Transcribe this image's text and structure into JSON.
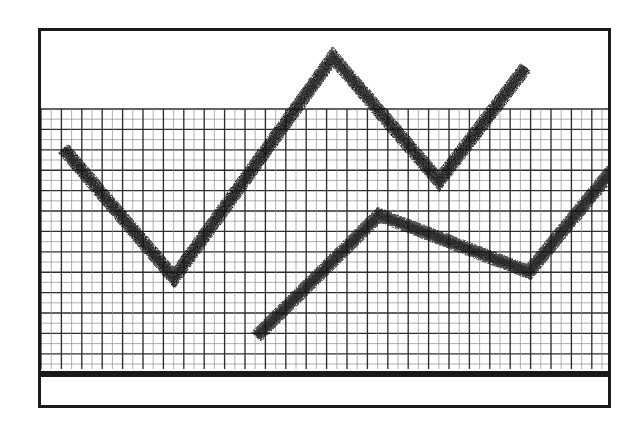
{
  "figure": {
    "kind": "hand-drawn-line-chart",
    "background_color": "#ffffff",
    "ink_color": "#111111",
    "frame": {
      "border_color": "#1a1a1a",
      "border_width_px": 3,
      "x": 38,
      "y": 28,
      "width": 573,
      "height": 380
    },
    "grid": {
      "visible": true,
      "color_minor": "#8e8e8e",
      "color_major": "#2f2f2f",
      "cell_px": 10.2,
      "major_every": 2,
      "top_px": 78,
      "bottom_px": 338,
      "left_px": 0,
      "right_px": 570
    },
    "baseline_bar": {
      "visible": true,
      "color": "#1a1a1a",
      "top_px": 340,
      "height_px": 6
    }
  },
  "chart_data": {
    "type": "line",
    "title": "",
    "subtitle": "",
    "xlabel": "",
    "ylabel": "",
    "grid": true,
    "legend_position": "none",
    "xlim": [
      0,
      573
    ],
    "ylim": [
      0,
      380
    ],
    "axis_tick_labels": {
      "x": [],
      "y": []
    },
    "annotations": [],
    "series": [
      {
        "name": "upper-trace",
        "stroke_width": 14,
        "texture": "stipple",
        "points": [
          {
            "x": 22,
            "y": 117
          },
          {
            "x": 133,
            "y": 247
          },
          {
            "x": 292,
            "y": 26
          },
          {
            "x": 398,
            "y": 150
          },
          {
            "x": 485,
            "y": 36
          }
        ]
      },
      {
        "name": "lower-trace",
        "stroke_width": 14,
        "texture": "stipple",
        "points": [
          {
            "x": 215,
            "y": 306
          },
          {
            "x": 338,
            "y": 184
          },
          {
            "x": 488,
            "y": 241
          },
          {
            "x": 573,
            "y": 137
          }
        ]
      }
    ]
  }
}
